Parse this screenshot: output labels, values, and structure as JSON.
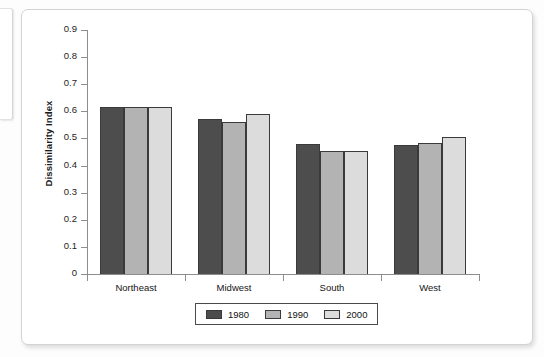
{
  "chart_data": {
    "type": "bar",
    "title": "",
    "xlabel": "",
    "ylabel": "Dissimilarity Index",
    "categories": [
      "Northeast",
      "Midwest",
      "South",
      "West"
    ],
    "series": [
      {
        "name": "1980",
        "color": "#4d4d4d",
        "values": [
          0.615,
          0.57,
          0.48,
          0.475
        ]
      },
      {
        "name": "1990",
        "color": "#b3b3b3",
        "values": [
          0.615,
          0.56,
          0.455,
          0.485
        ]
      },
      {
        "name": "2000",
        "color": "#dcdcdc",
        "values": [
          0.615,
          0.59,
          0.455,
          0.505
        ]
      }
    ],
    "ylim": [
      0,
      0.9
    ],
    "ytick_labels": [
      "0.9",
      "0.8",
      "0.7",
      "0.6",
      "0.5",
      "0.4",
      "0.3",
      "0.2",
      "0.1",
      "0"
    ],
    "ytick_values": [
      0.9,
      0.8,
      0.7,
      0.6,
      0.5,
      0.4,
      0.3,
      0.2,
      0.1,
      0
    ],
    "grid": false,
    "legend_position": "bottom",
    "legend_entries": [
      "1980",
      "1990",
      "2000"
    ]
  }
}
